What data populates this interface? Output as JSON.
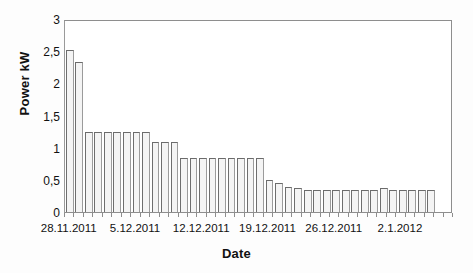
{
  "chart_data": {
    "type": "bar",
    "title": "",
    "xlabel": "Date",
    "ylabel": "Power kW",
    "ylim": [
      0,
      3
    ],
    "ytick_labels": [
      "3",
      "2,5",
      "2",
      "1,5",
      "1",
      "0,5",
      "0"
    ],
    "ytick_values": [
      3,
      2.5,
      2,
      1.5,
      1,
      0.5,
      0
    ],
    "grid": false,
    "legend": null,
    "x_axis_type": "date",
    "xtick_labels": [
      "28.11.2011",
      "5.12.2011",
      "12.12.2011",
      "19.12.2011",
      "26.12.2011",
      "2.1.2012"
    ],
    "xtick_indices": [
      0,
      7,
      14,
      21,
      28,
      35
    ],
    "categories": [
      "28.11.2011",
      "29.11.2011",
      "30.11.2011",
      "1.12.2011",
      "2.12.2011",
      "3.12.2011",
      "4.12.2011",
      "5.12.2011",
      "6.12.2011",
      "7.12.2011",
      "8.12.2011",
      "9.12.2011",
      "10.12.2011",
      "11.12.2011",
      "12.12.2011",
      "13.12.2011",
      "14.12.2011",
      "15.12.2011",
      "16.12.2011",
      "17.12.2011",
      "18.12.2011",
      "19.12.2011",
      "20.12.2011",
      "21.12.2011",
      "22.12.2011",
      "23.12.2011",
      "24.12.2011",
      "25.12.2011",
      "26.12.2011",
      "27.12.2011",
      "28.12.2011",
      "29.12.2011",
      "30.12.2011",
      "31.12.2011",
      "1.1.2012",
      "2.1.2012",
      "3.1.2012",
      "4.1.2012",
      "5.1.2012"
    ],
    "values": [
      2.55,
      2.35,
      1.25,
      1.25,
      1.25,
      1.25,
      1.25,
      1.25,
      1.25,
      1.1,
      1.1,
      1.1,
      0.85,
      0.85,
      0.85,
      0.85,
      0.85,
      0.85,
      0.85,
      0.85,
      0.85,
      0.5,
      0.45,
      0.4,
      0.37,
      0.35,
      0.35,
      0.35,
      0.35,
      0.35,
      0.35,
      0.35,
      0.35,
      0.38,
      0.35,
      0.35,
      0.35,
      0.35,
      0.35
    ],
    "series": [
      {
        "name": "Power kW",
        "values": [
          2.55,
          2.35,
          1.25,
          1.25,
          1.25,
          1.25,
          1.25,
          1.25,
          1.25,
          1.1,
          1.1,
          1.1,
          0.85,
          0.85,
          0.85,
          0.85,
          0.85,
          0.85,
          0.85,
          0.85,
          0.85,
          0.5,
          0.45,
          0.4,
          0.37,
          0.35,
          0.35,
          0.35,
          0.35,
          0.35,
          0.35,
          0.35,
          0.35,
          0.38,
          0.35,
          0.35,
          0.35,
          0.35,
          0.35
        ]
      }
    ],
    "colors": {
      "bar_fill": "#f4f4f4",
      "bar_edge": "#6e6e6e",
      "axis": "#8e8e8e",
      "text": "#111111",
      "background": "#ffffff"
    }
  }
}
